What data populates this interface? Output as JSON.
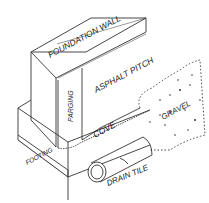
{
  "diagram": {
    "labels": {
      "foundation_wall": "FOUNDATION WALL",
      "asphalt_pitch": "ASPHALT PITCH",
      "parging": "PARGING",
      "cove": "COVE",
      "gravel": "GRAVEL",
      "footing": "FOOTING",
      "drain_tile": "DRAIN TILE"
    },
    "colors": {
      "line": "#333333",
      "background": "#ffffff"
    }
  }
}
